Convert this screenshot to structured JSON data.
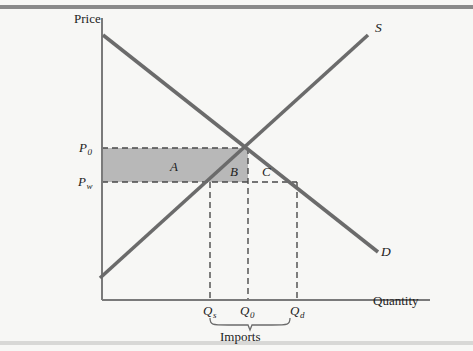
{
  "figure": {
    "type": "economics-supply-demand-imports-diagram",
    "axes": {
      "y_label": "Price",
      "x_label": "Quantity"
    },
    "curves": [
      {
        "id": "supply",
        "label": "S",
        "description": "upward sloping supply curve"
      },
      {
        "id": "demand",
        "label": "D",
        "description": "downward sloping demand curve"
      }
    ],
    "price_ticks": [
      {
        "id": "p0",
        "label_base": "P",
        "label_sub": "0",
        "description": "autarky equilibrium price"
      },
      {
        "id": "pw",
        "label_base": "P",
        "label_sub": "w",
        "description": "world price"
      }
    ],
    "quantity_ticks": [
      {
        "id": "qs",
        "label_base": "Q",
        "label_sub": "s",
        "description": "domestic quantity supplied at world price"
      },
      {
        "id": "q0",
        "label_base": "Q",
        "label_sub": "0",
        "description": "autarky equilibrium quantity"
      },
      {
        "id": "qd",
        "label_base": "Q",
        "label_sub": "d",
        "description": "domestic quantity demanded at world price"
      }
    ],
    "regions": [
      {
        "id": "a",
        "label": "A",
        "shaded": true,
        "description": "shaded rectangle between P0 and Pw left of supply curve"
      },
      {
        "id": "b",
        "label": "B",
        "shaded": false,
        "description": "triangle left of equilibrium above Pw"
      },
      {
        "id": "c",
        "label": "C",
        "shaded": false,
        "description": "triangle right of equilibrium above Pw"
      }
    ],
    "bracket": {
      "label": "Imports",
      "spans_from": "Qs",
      "spans_to": "Qd"
    },
    "colors": {
      "background": "#f7f7f5",
      "curve": "#6b6b6b",
      "axis": "#7a7a7a",
      "shaded_region": "#b8b8b8",
      "dashed": "#4a4a4a",
      "text": "#1d1d1d",
      "rule_top": "#8a8a8a",
      "rule_bottom": "#d8d8d6"
    },
    "geometry": {
      "origin": [
        102,
        300
      ],
      "y_axis_top": 18,
      "x_axis_right": 430,
      "p0_y": 148,
      "pw_y": 182,
      "qs_x": 210,
      "q0_x": 248,
      "qd_x": 297,
      "supply_from": [
        100,
        278
      ],
      "supply_to": [
        368,
        35
      ],
      "demand_from": [
        103,
        35
      ],
      "demand_to": [
        378,
        252
      ]
    }
  }
}
